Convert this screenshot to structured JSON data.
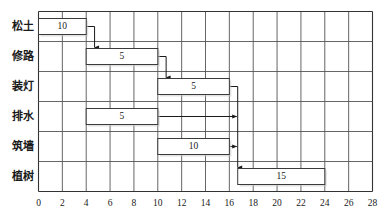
{
  "chart_data": {
    "type": "bar",
    "chart_kind": "gantt",
    "title": "",
    "xlabel": "",
    "ylabel": "",
    "xlim": [
      0,
      28
    ],
    "x_tick_step": 2,
    "x_ticks": [
      0,
      2,
      4,
      6,
      8,
      10,
      12,
      14,
      16,
      18,
      20,
      22,
      24,
      26,
      28
    ],
    "x_tick_labels": [
      "0",
      "2",
      "4",
      "6",
      "8",
      "10",
      "12",
      "14",
      "16",
      "18",
      "20",
      "22",
      "24",
      "26",
      "28"
    ],
    "grid": true,
    "legend": false,
    "categories": [
      "松土",
      "修路",
      "装灯",
      "排水",
      "筑墙",
      "植树"
    ],
    "tasks": [
      {
        "name": "松土",
        "row": 0,
        "start": 0.0,
        "end": 4.0,
        "label": "10"
      },
      {
        "name": "修路",
        "row": 1,
        "start": 4.0,
        "end": 10.0,
        "label": "5"
      },
      {
        "name": "装灯",
        "row": 2,
        "start": 10.0,
        "end": 16.0,
        "label": "5"
      },
      {
        "name": "排水",
        "row": 3,
        "start": 4.0,
        "end": 10.0,
        "label": "5"
      },
      {
        "name": "筑墙",
        "row": 4,
        "start": 10.0,
        "end": 16.0,
        "label": "10"
      },
      {
        "name": "植树",
        "row": 5,
        "start": 16.7,
        "end": 24.0,
        "label": "15"
      }
    ],
    "values": [
      10,
      5,
      5,
      5,
      10,
      15
    ],
    "dependencies": [
      {
        "from": "松土",
        "to": "修路",
        "at_x": 4.7,
        "kind": "down-arrow"
      },
      {
        "from": "修路",
        "to": "装灯",
        "at_x": 10.7,
        "kind": "down-arrow"
      },
      {
        "from": "装灯",
        "to": "植树",
        "at_x": 16.7,
        "kind": "down-arrow"
      },
      {
        "from": "排水",
        "to": "装灯-line",
        "at_x": 16.7,
        "kind": "right-arrow"
      },
      {
        "from": "筑墙",
        "to": "装灯-line",
        "at_x": 16.7,
        "kind": "right-arrow"
      }
    ],
    "colors": {
      "bar_fill": "#ffffff",
      "bar_stroke": "#3a3a3a",
      "grid": "#555555",
      "frame": "#333333",
      "text": "#1a1a1a"
    }
  }
}
